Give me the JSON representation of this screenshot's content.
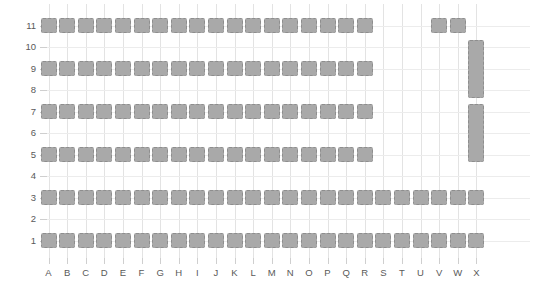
{
  "chart_data": {
    "type": "heatmap",
    "title": "",
    "xlabel": "",
    "ylabel": "",
    "x_tick_labels": [
      "A",
      "B",
      "C",
      "D",
      "E",
      "F",
      "G",
      "H",
      "I",
      "J",
      "K",
      "L",
      "M",
      "N",
      "O",
      "P",
      "Q",
      "R",
      "S",
      "T",
      "U",
      "V",
      "W",
      "X"
    ],
    "y_tick_labels": [
      "1",
      "2",
      "3",
      "4",
      "5",
      "6",
      "7",
      "8",
      "9",
      "10",
      "11"
    ],
    "xlim": [
      0,
      24
    ],
    "ylim": [
      0,
      12
    ],
    "grid": true,
    "legend": "none",
    "colors": {
      "cell_fill": "#a9a9a9",
      "cell_border": "#8e8e8e",
      "vertical_gridline": "#e3e3e3",
      "horizontal_gridline": "#ececec",
      "tick_label": "#595959",
      "background": "#ffffff"
    },
    "note": "Seating-chart style occupancy grid. Filled cells denote occupied seats; tall cells span multiple rows.",
    "cells": [
      {
        "col": "A",
        "row": 11,
        "rowspan": 1
      },
      {
        "col": "B",
        "row": 11,
        "rowspan": 1
      },
      {
        "col": "C",
        "row": 11,
        "rowspan": 1
      },
      {
        "col": "D",
        "row": 11,
        "rowspan": 1
      },
      {
        "col": "E",
        "row": 11,
        "rowspan": 1
      },
      {
        "col": "F",
        "row": 11,
        "rowspan": 1
      },
      {
        "col": "G",
        "row": 11,
        "rowspan": 1
      },
      {
        "col": "H",
        "row": 11,
        "rowspan": 1
      },
      {
        "col": "I",
        "row": 11,
        "rowspan": 1
      },
      {
        "col": "J",
        "row": 11,
        "rowspan": 1
      },
      {
        "col": "K",
        "row": 11,
        "rowspan": 1
      },
      {
        "col": "L",
        "row": 11,
        "rowspan": 1
      },
      {
        "col": "M",
        "row": 11,
        "rowspan": 1
      },
      {
        "col": "N",
        "row": 11,
        "rowspan": 1
      },
      {
        "col": "O",
        "row": 11,
        "rowspan": 1
      },
      {
        "col": "P",
        "row": 11,
        "rowspan": 1
      },
      {
        "col": "Q",
        "row": 11,
        "rowspan": 1
      },
      {
        "col": "R",
        "row": 11,
        "rowspan": 1
      },
      {
        "col": "V",
        "row": 11,
        "rowspan": 1
      },
      {
        "col": "W",
        "row": 11,
        "rowspan": 1
      },
      {
        "col": "A",
        "row": 9,
        "rowspan": 1
      },
      {
        "col": "B",
        "row": 9,
        "rowspan": 1
      },
      {
        "col": "C",
        "row": 9,
        "rowspan": 1
      },
      {
        "col": "D",
        "row": 9,
        "rowspan": 1
      },
      {
        "col": "E",
        "row": 9,
        "rowspan": 1
      },
      {
        "col": "F",
        "row": 9,
        "rowspan": 1
      },
      {
        "col": "G",
        "row": 9,
        "rowspan": 1
      },
      {
        "col": "H",
        "row": 9,
        "rowspan": 1
      },
      {
        "col": "I",
        "row": 9,
        "rowspan": 1
      },
      {
        "col": "J",
        "row": 9,
        "rowspan": 1
      },
      {
        "col": "K",
        "row": 9,
        "rowspan": 1
      },
      {
        "col": "L",
        "row": 9,
        "rowspan": 1
      },
      {
        "col": "M",
        "row": 9,
        "rowspan": 1
      },
      {
        "col": "N",
        "row": 9,
        "rowspan": 1
      },
      {
        "col": "O",
        "row": 9,
        "rowspan": 1
      },
      {
        "col": "P",
        "row": 9,
        "rowspan": 1
      },
      {
        "col": "Q",
        "row": 9,
        "rowspan": 1
      },
      {
        "col": "R",
        "row": 9,
        "rowspan": 1
      },
      {
        "col": "A",
        "row": 7,
        "rowspan": 1
      },
      {
        "col": "B",
        "row": 7,
        "rowspan": 1
      },
      {
        "col": "C",
        "row": 7,
        "rowspan": 1
      },
      {
        "col": "D",
        "row": 7,
        "rowspan": 1
      },
      {
        "col": "E",
        "row": 7,
        "rowspan": 1
      },
      {
        "col": "F",
        "row": 7,
        "rowspan": 1
      },
      {
        "col": "G",
        "row": 7,
        "rowspan": 1
      },
      {
        "col": "H",
        "row": 7,
        "rowspan": 1
      },
      {
        "col": "I",
        "row": 7,
        "rowspan": 1
      },
      {
        "col": "J",
        "row": 7,
        "rowspan": 1
      },
      {
        "col": "K",
        "row": 7,
        "rowspan": 1
      },
      {
        "col": "L",
        "row": 7,
        "rowspan": 1
      },
      {
        "col": "M",
        "row": 7,
        "rowspan": 1
      },
      {
        "col": "N",
        "row": 7,
        "rowspan": 1
      },
      {
        "col": "O",
        "row": 7,
        "rowspan": 1
      },
      {
        "col": "P",
        "row": 7,
        "rowspan": 1
      },
      {
        "col": "Q",
        "row": 7,
        "rowspan": 1
      },
      {
        "col": "R",
        "row": 7,
        "rowspan": 1
      },
      {
        "col": "A",
        "row": 5,
        "rowspan": 1
      },
      {
        "col": "B",
        "row": 5,
        "rowspan": 1
      },
      {
        "col": "C",
        "row": 5,
        "rowspan": 1
      },
      {
        "col": "D",
        "row": 5,
        "rowspan": 1
      },
      {
        "col": "E",
        "row": 5,
        "rowspan": 1
      },
      {
        "col": "F",
        "row": 5,
        "rowspan": 1
      },
      {
        "col": "G",
        "row": 5,
        "rowspan": 1
      },
      {
        "col": "H",
        "row": 5,
        "rowspan": 1
      },
      {
        "col": "I",
        "row": 5,
        "rowspan": 1
      },
      {
        "col": "J",
        "row": 5,
        "rowspan": 1
      },
      {
        "col": "K",
        "row": 5,
        "rowspan": 1
      },
      {
        "col": "L",
        "row": 5,
        "rowspan": 1
      },
      {
        "col": "M",
        "row": 5,
        "rowspan": 1
      },
      {
        "col": "N",
        "row": 5,
        "rowspan": 1
      },
      {
        "col": "O",
        "row": 5,
        "rowspan": 1
      },
      {
        "col": "P",
        "row": 5,
        "rowspan": 1
      },
      {
        "col": "Q",
        "row": 5,
        "rowspan": 1
      },
      {
        "col": "R",
        "row": 5,
        "rowspan": 1
      },
      {
        "col": "A",
        "row": 3,
        "rowspan": 1
      },
      {
        "col": "B",
        "row": 3,
        "rowspan": 1
      },
      {
        "col": "C",
        "row": 3,
        "rowspan": 1
      },
      {
        "col": "D",
        "row": 3,
        "rowspan": 1
      },
      {
        "col": "E",
        "row": 3,
        "rowspan": 1
      },
      {
        "col": "F",
        "row": 3,
        "rowspan": 1
      },
      {
        "col": "G",
        "row": 3,
        "rowspan": 1
      },
      {
        "col": "H",
        "row": 3,
        "rowspan": 1
      },
      {
        "col": "I",
        "row": 3,
        "rowspan": 1
      },
      {
        "col": "J",
        "row": 3,
        "rowspan": 1
      },
      {
        "col": "K",
        "row": 3,
        "rowspan": 1
      },
      {
        "col": "L",
        "row": 3,
        "rowspan": 1
      },
      {
        "col": "M",
        "row": 3,
        "rowspan": 1
      },
      {
        "col": "N",
        "row": 3,
        "rowspan": 1
      },
      {
        "col": "O",
        "row": 3,
        "rowspan": 1
      },
      {
        "col": "P",
        "row": 3,
        "rowspan": 1
      },
      {
        "col": "Q",
        "row": 3,
        "rowspan": 1
      },
      {
        "col": "R",
        "row": 3,
        "rowspan": 1
      },
      {
        "col": "S",
        "row": 3,
        "rowspan": 1
      },
      {
        "col": "T",
        "row": 3,
        "rowspan": 1
      },
      {
        "col": "U",
        "row": 3,
        "rowspan": 1
      },
      {
        "col": "V",
        "row": 3,
        "rowspan": 1
      },
      {
        "col": "W",
        "row": 3,
        "rowspan": 1
      },
      {
        "col": "X",
        "row": 3,
        "rowspan": 1
      },
      {
        "col": "A",
        "row": 1,
        "rowspan": 1
      },
      {
        "col": "B",
        "row": 1,
        "rowspan": 1
      },
      {
        "col": "C",
        "row": 1,
        "rowspan": 1
      },
      {
        "col": "D",
        "row": 1,
        "rowspan": 1
      },
      {
        "col": "E",
        "row": 1,
        "rowspan": 1
      },
      {
        "col": "F",
        "row": 1,
        "rowspan": 1
      },
      {
        "col": "G",
        "row": 1,
        "rowspan": 1
      },
      {
        "col": "H",
        "row": 1,
        "rowspan": 1
      },
      {
        "col": "I",
        "row": 1,
        "rowspan": 1
      },
      {
        "col": "J",
        "row": 1,
        "rowspan": 1
      },
      {
        "col": "K",
        "row": 1,
        "rowspan": 1
      },
      {
        "col": "L",
        "row": 1,
        "rowspan": 1
      },
      {
        "col": "M",
        "row": 1,
        "rowspan": 1
      },
      {
        "col": "N",
        "row": 1,
        "rowspan": 1
      },
      {
        "col": "O",
        "row": 1,
        "rowspan": 1
      },
      {
        "col": "P",
        "row": 1,
        "rowspan": 1
      },
      {
        "col": "Q",
        "row": 1,
        "rowspan": 1
      },
      {
        "col": "R",
        "row": 1,
        "rowspan": 1
      },
      {
        "col": "S",
        "row": 1,
        "rowspan": 1
      },
      {
        "col": "T",
        "row": 1,
        "rowspan": 1
      },
      {
        "col": "U",
        "row": 1,
        "rowspan": 1
      },
      {
        "col": "V",
        "row": 1,
        "rowspan": 1
      },
      {
        "col": "W",
        "row": 1,
        "rowspan": 1
      },
      {
        "col": "X",
        "row": 1,
        "rowspan": 1
      },
      {
        "col": "X",
        "row": 10,
        "rowspan": 3
      },
      {
        "col": "X",
        "row": 7,
        "rowspan": 3
      }
    ]
  }
}
